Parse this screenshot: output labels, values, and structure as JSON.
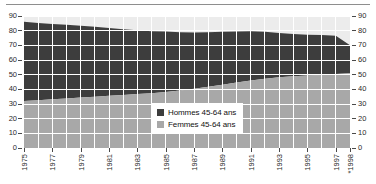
{
  "chart_data": {
    "type": "area",
    "stacked": true,
    "title": "",
    "subtitle": "",
    "xlabel": "",
    "ylabel": "",
    "grid": true,
    "legend_position": "inside-center-right",
    "ylim": [
      0,
      90
    ],
    "y_ticks": [
      0,
      10,
      20,
      30,
      40,
      50,
      60,
      70,
      80,
      90
    ],
    "y_ticks_right": [
      0,
      10,
      20,
      30,
      40,
      50,
      60,
      70,
      80,
      90
    ],
    "x": [
      1975,
      1976,
      1977,
      1978,
      1979,
      1980,
      1981,
      1982,
      1983,
      1984,
      1985,
      1986,
      1987,
      1988,
      1989,
      1990,
      1991,
      1992,
      1993,
      1994,
      1995,
      1996,
      1997,
      1998
    ],
    "x_tick_labels": [
      "1975",
      "1977",
      "1979",
      "1981",
      "1983",
      "1985",
      "1987",
      "1989",
      "1991",
      "1993",
      "1995",
      "1997",
      "*1998"
    ],
    "x_tick_values": [
      1975,
      1977,
      1979,
      1981,
      1983,
      1985,
      1987,
      1989,
      1991,
      1993,
      1995,
      1997,
      1998
    ],
    "series": [
      {
        "name": "Femmes 45-64 ans",
        "color": "#a8a8a8",
        "values": [
          32.0,
          32.6,
          33.2,
          33.8,
          34.4,
          35.0,
          35.6,
          36.2,
          36.8,
          37.4,
          38.2,
          39.2,
          40.4,
          41.8,
          43.2,
          44.6,
          46.0,
          47.2,
          48.2,
          48.9,
          49.4,
          49.8,
          50.4,
          51.0
        ]
      },
      {
        "name": "Hommes 45-64 ans",
        "color": "#3d3d3d",
        "values": [
          54.0,
          52.6,
          51.4,
          50.2,
          49.0,
          47.6,
          46.2,
          44.8,
          43.4,
          42.2,
          41.2,
          39.8,
          38.4,
          37.2,
          36.0,
          34.8,
          33.6,
          32.0,
          30.2,
          28.9,
          27.9,
          27.2,
          26.1,
          19.0
        ]
      }
    ],
    "boundaries": {
      "femmes_top": [
        32.0,
        32.6,
        33.2,
        33.8,
        34.4,
        35.0,
        35.6,
        36.2,
        36.8,
        37.4,
        38.2,
        39.2,
        40.4,
        41.8,
        43.2,
        44.6,
        46.0,
        47.2,
        48.2,
        48.9,
        49.4,
        49.8,
        50.4,
        51.0
      ],
      "hommes_top": [
        86.0,
        85.2,
        84.6,
        84.0,
        83.4,
        82.6,
        81.8,
        81.0,
        80.2,
        79.6,
        79.4,
        79.0,
        78.8,
        79.0,
        79.2,
        79.4,
        79.6,
        79.2,
        78.4,
        77.8,
        77.3,
        77.0,
        76.5,
        70.0
      ]
    },
    "band_top_color": "#ececec",
    "gridline_color": "#ffffff"
  },
  "legend": {
    "items": [
      {
        "label": "Hommes 45-64 ans",
        "color": "#3d3d3d"
      },
      {
        "label": "Femmes 45-64 ans",
        "color": "#a8a8a8"
      }
    ]
  }
}
